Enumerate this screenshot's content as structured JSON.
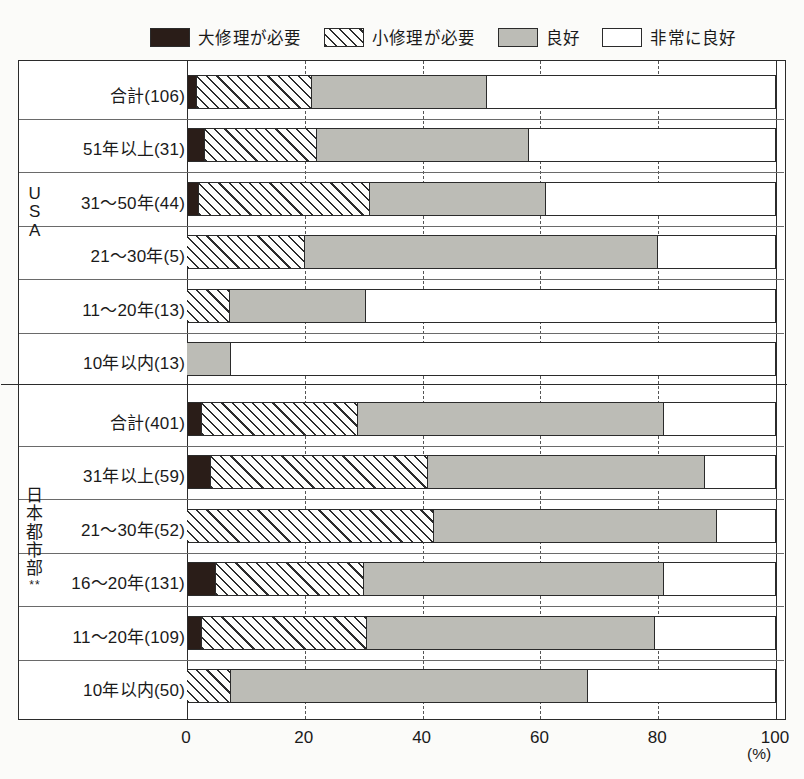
{
  "legend": {
    "items": [
      {
        "label": "大修理が必要",
        "key": "major",
        "color": "#2a1d18"
      },
      {
        "label": "小修理が必要",
        "key": "minor",
        "color": "#ffffff"
      },
      {
        "label": "良好",
        "key": "good",
        "color": "#bcbcb6"
      },
      {
        "label": "非常に良好",
        "key": "verygood",
        "color": "#ffffff"
      }
    ]
  },
  "groups": [
    {
      "name": "USA",
      "chars": [
        "U",
        "S",
        "A"
      ],
      "stars": ""
    },
    {
      "name": "日本都市部**",
      "chars": [
        "日",
        "本",
        "都",
        "市",
        "部"
      ],
      "stars": "**"
    }
  ],
  "axis": {
    "ticks": [
      0,
      20,
      40,
      60,
      80,
      100
    ],
    "tick_labels": [
      "0",
      "20",
      "40",
      "60",
      "80",
      "100"
    ],
    "unit": "(%)",
    "min": 0,
    "max": 100
  },
  "chart_data": {
    "type": "bar",
    "orientation": "horizontal",
    "stacked": true,
    "title": "",
    "xlabel": "(%)",
    "ylabel": "",
    "xlim": [
      0,
      100
    ],
    "grid": true,
    "legend_position": "top",
    "series": [
      {
        "name": "大修理が必要",
        "key": "major",
        "values": [
          1.7,
          3.0,
          2.0,
          0.0,
          0.0,
          0.0,
          2.5,
          4.0,
          0.0,
          5.0,
          2.5,
          0.0
        ]
      },
      {
        "name": "小修理が必要",
        "key": "minor",
        "values": [
          19.5,
          19.0,
          29.0,
          20.0,
          7.3,
          0.0,
          26.5,
          37.0,
          42.0,
          25.0,
          28.0,
          7.5
        ]
      },
      {
        "name": "良好",
        "key": "good",
        "values": [
          29.8,
          36.0,
          30.0,
          60.0,
          23.1,
          7.5,
          52.0,
          47.0,
          48.0,
          51.0,
          49.0,
          60.5
        ]
      },
      {
        "name": "非常に良好",
        "key": "verygood",
        "values": [
          49.0,
          42.0,
          39.0,
          20.0,
          69.6,
          92.5,
          19.0,
          12.0,
          10.0,
          19.0,
          20.5,
          32.0
        ]
      }
    ],
    "categories": [
      "合計(106)",
      "51年以上(31)",
      "31〜50年(44)",
      "21〜30年(5)",
      "11〜20年(13)",
      "10年以内(13)",
      "合計(401)",
      "31年以上(59)",
      "21〜30年(52)",
      "16〜20年(131)",
      "11〜20年(109)",
      "10年以内(50)"
    ],
    "group_of_category": [
      "USA",
      "USA",
      "USA",
      "USA",
      "USA",
      "USA",
      "日本都市部",
      "日本都市部",
      "日本都市部",
      "日本都市部",
      "日本都市部",
      "日本都市部"
    ]
  },
  "rows": [
    {
      "label": "合計(106)",
      "group": 0,
      "major": 1.7,
      "minor": 19.5,
      "good": 29.8,
      "verygood": 49.0
    },
    {
      "label": "51年以上(31)",
      "group": 0,
      "major": 3.0,
      "minor": 19.0,
      "good": 36.0,
      "verygood": 42.0
    },
    {
      "label": "31〜50年(44)",
      "group": 0,
      "major": 2.0,
      "minor": 29.0,
      "good": 30.0,
      "verygood": 39.0
    },
    {
      "label": "21〜30年(5)",
      "group": 0,
      "major": 0.0,
      "minor": 20.0,
      "good": 60.0,
      "verygood": 20.0
    },
    {
      "label": "11〜20年(13)",
      "group": 0,
      "major": 0.0,
      "minor": 7.3,
      "good": 23.1,
      "verygood": 69.6
    },
    {
      "label": "10年以内(13)",
      "group": 0,
      "major": 0.0,
      "minor": 0.0,
      "good": 7.5,
      "verygood": 92.5
    },
    {
      "label": "合計(401)",
      "group": 1,
      "major": 2.5,
      "minor": 26.5,
      "good": 52.0,
      "verygood": 19.0
    },
    {
      "label": "31年以上(59)",
      "group": 1,
      "major": 4.0,
      "minor": 37.0,
      "good": 47.0,
      "verygood": 12.0
    },
    {
      "label": "21〜30年(52)",
      "group": 1,
      "major": 0.0,
      "minor": 42.0,
      "good": 48.0,
      "verygood": 10.0
    },
    {
      "label": "16〜20年(131)",
      "group": 1,
      "major": 5.0,
      "minor": 25.0,
      "good": 51.0,
      "verygood": 19.0
    },
    {
      "label": "11〜20年(109)",
      "group": 1,
      "major": 2.5,
      "minor": 28.0,
      "good": 49.0,
      "verygood": 20.5
    },
    {
      "label": "10年以内(50)",
      "group": 1,
      "major": 0.0,
      "minor": 7.5,
      "good": 60.5,
      "verygood": 32.0
    }
  ]
}
